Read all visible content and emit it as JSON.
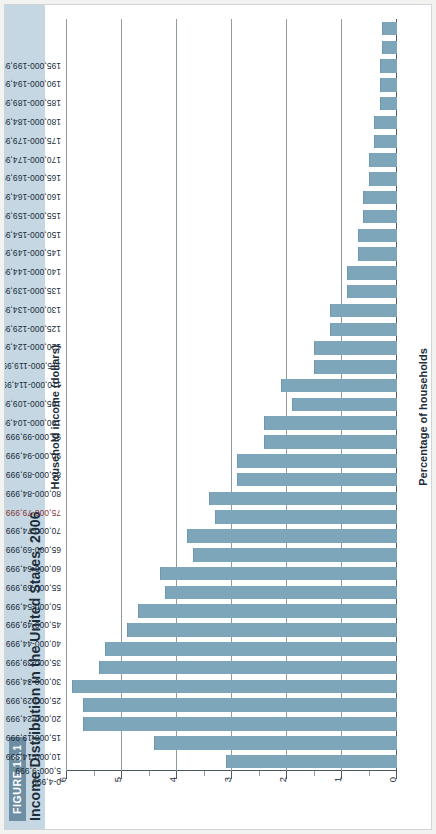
{
  "figure": {
    "badge": "FIGURE 13.1",
    "title": "Income Distribution in the United States, 2006"
  },
  "colors": {
    "bar": "#7da6ba",
    "band": "#c5d7e2",
    "badge": "#6e8ea4",
    "grid": "#8e9ba2",
    "highlight": "#8c3a3a"
  },
  "chart_data": {
    "type": "bar",
    "orientation": "horizontal",
    "title": "Income Distribution in the United States, 2006",
    "xlabel": "Percentage of households",
    "ylabel": "Household income (dollars)",
    "ylim": [
      0,
      6
    ],
    "tick_labels": [
      "0",
      "1",
      "2",
      "3",
      "4",
      "5",
      "6"
    ],
    "tick_values": [
      0,
      1,
      2,
      3,
      4,
      5,
      6
    ],
    "grid": true,
    "legend": "none",
    "highlight_category": "75,000-79,999",
    "categories": [
      "0-4,999",
      "5,000-9,999",
      "10,000-14,999",
      "15,000-19,999",
      "20,000-24,999",
      "25,000-29,999",
      "30,000-34,999",
      "35,000-39,999",
      "40,000-44,999",
      "45,000-49,999",
      "50,000-54,999",
      "55,000-59,999",
      "60,000-64,999",
      "65,000-69,999",
      "70,000-74,999",
      "75,000-79,999",
      "80,000-84,999",
      "85,000-89,999",
      "90,000-94,999",
      "95,000-99,999",
      "100,000-104,999",
      "105,000-109,999",
      "110,000-114,999",
      "115,000-119,999",
      "120,000-124,999",
      "125,000-129,999",
      "130,000-134,999",
      "135,000-139,999",
      "140,000-144,999",
      "145,000-149,999",
      "150,000-154,999",
      "155,000-159,999",
      "160,000-164,999",
      "165,000-169,999",
      "170,000-174,999",
      "175,000-179,999",
      "180,000-184,999",
      "185,000-189,999",
      "190,000-194,999",
      "195,000-199,999"
    ],
    "values": [
      3.1,
      4.4,
      5.7,
      5.7,
      5.9,
      5.4,
      5.3,
      4.9,
      4.7,
      4.2,
      4.3,
      3.7,
      3.8,
      3.3,
      3.4,
      2.9,
      2.9,
      2.4,
      2.4,
      1.9,
      2.1,
      1.5,
      1.5,
      1.2,
      1.2,
      0.9,
      0.9,
      0.7,
      0.7,
      0.6,
      0.6,
      0.5,
      0.5,
      0.4,
      0.4,
      0.3,
      0.3,
      0.3,
      0.25,
      0.25
    ]
  }
}
